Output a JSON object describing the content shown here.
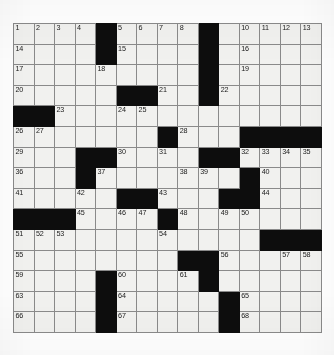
{
  "puzzle": {
    "type": "crossword-grid",
    "rows": 15,
    "cols": 15,
    "block_color": "#0d0d0d",
    "cell_color": "#f1f1ef",
    "grid_line_color": "#8a8a8a",
    "number_color": "#1a1a1a",
    "blocks": [
      [
        1,
        5
      ],
      [
        1,
        10
      ],
      [
        2,
        5
      ],
      [
        2,
        10
      ],
      [
        3,
        10
      ],
      [
        4,
        6
      ],
      [
        4,
        7
      ],
      [
        4,
        10
      ],
      [
        5,
        1
      ],
      [
        5,
        2
      ],
      [
        6,
        8
      ],
      [
        6,
        12
      ],
      [
        6,
        13
      ],
      [
        6,
        14
      ],
      [
        6,
        15
      ],
      [
        7,
        4
      ],
      [
        7,
        5
      ],
      [
        7,
        10
      ],
      [
        7,
        11
      ],
      [
        8,
        4
      ],
      [
        8,
        12
      ],
      [
        9,
        6
      ],
      [
        9,
        7
      ],
      [
        9,
        11
      ],
      [
        9,
        12
      ],
      [
        10,
        1
      ],
      [
        10,
        2
      ],
      [
        10,
        3
      ],
      [
        10,
        8
      ],
      [
        11,
        13
      ],
      [
        11,
        14
      ],
      [
        11,
        15
      ],
      [
        12,
        9
      ],
      [
        12,
        10
      ],
      [
        13,
        5
      ],
      [
        13,
        10
      ],
      [
        14,
        5
      ],
      [
        14,
        11
      ],
      [
        15,
        5
      ],
      [
        15,
        11
      ]
    ],
    "numbers": [
      {
        "row": 1,
        "col": 1,
        "n": "1"
      },
      {
        "row": 1,
        "col": 2,
        "n": "2"
      },
      {
        "row": 1,
        "col": 3,
        "n": "3"
      },
      {
        "row": 1,
        "col": 4,
        "n": "4"
      },
      {
        "row": 1,
        "col": 6,
        "n": "5"
      },
      {
        "row": 1,
        "col": 7,
        "n": "6"
      },
      {
        "row": 1,
        "col": 8,
        "n": "7"
      },
      {
        "row": 1,
        "col": 9,
        "n": "8"
      },
      {
        "row": 1,
        "col": 10,
        "n": "9"
      },
      {
        "row": 1,
        "col": 12,
        "n": "10"
      },
      {
        "row": 1,
        "col": 13,
        "n": "11"
      },
      {
        "row": 1,
        "col": 14,
        "n": "12"
      },
      {
        "row": 1,
        "col": 15,
        "n": "13"
      },
      {
        "row": 2,
        "col": 1,
        "n": "14"
      },
      {
        "row": 2,
        "col": 6,
        "n": "15"
      },
      {
        "row": 2,
        "col": 12,
        "n": "16"
      },
      {
        "row": 3,
        "col": 1,
        "n": "17"
      },
      {
        "row": 3,
        "col": 5,
        "n": "18"
      },
      {
        "row": 3,
        "col": 12,
        "n": "19"
      },
      {
        "row": 4,
        "col": 1,
        "n": "20"
      },
      {
        "row": 4,
        "col": 8,
        "n": "21"
      },
      {
        "row": 4,
        "col": 11,
        "n": "22"
      },
      {
        "row": 5,
        "col": 3,
        "n": "23"
      },
      {
        "row": 5,
        "col": 6,
        "n": "24"
      },
      {
        "row": 5,
        "col": 7,
        "n": "25"
      },
      {
        "row": 6,
        "col": 1,
        "n": "26"
      },
      {
        "row": 6,
        "col": 2,
        "n": "27"
      },
      {
        "row": 6,
        "col": 9,
        "n": "28"
      },
      {
        "row": 7,
        "col": 1,
        "n": "29"
      },
      {
        "row": 7,
        "col": 6,
        "n": "30"
      },
      {
        "row": 7,
        "col": 8,
        "n": "31"
      },
      {
        "row": 7,
        "col": 12,
        "n": "32"
      },
      {
        "row": 7,
        "col": 13,
        "n": "33"
      },
      {
        "row": 7,
        "col": 14,
        "n": "34"
      },
      {
        "row": 7,
        "col": 15,
        "n": "35"
      },
      {
        "row": 8,
        "col": 1,
        "n": "36"
      },
      {
        "row": 8,
        "col": 5,
        "n": "37"
      },
      {
        "row": 8,
        "col": 9,
        "n": "38"
      },
      {
        "row": 8,
        "col": 10,
        "n": "39"
      },
      {
        "row": 8,
        "col": 13,
        "n": "40"
      },
      {
        "row": 9,
        "col": 1,
        "n": "41"
      },
      {
        "row": 9,
        "col": 4,
        "n": "42"
      },
      {
        "row": 9,
        "col": 8,
        "n": "43"
      },
      {
        "row": 9,
        "col": 13,
        "n": "44"
      },
      {
        "row": 10,
        "col": 4,
        "n": "45"
      },
      {
        "row": 10,
        "col": 6,
        "n": "46"
      },
      {
        "row": 10,
        "col": 7,
        "n": "47"
      },
      {
        "row": 10,
        "col": 9,
        "n": "48"
      },
      {
        "row": 10,
        "col": 11,
        "n": "49"
      },
      {
        "row": 10,
        "col": 12,
        "n": "50"
      },
      {
        "row": 11,
        "col": 1,
        "n": "51"
      },
      {
        "row": 11,
        "col": 2,
        "n": "52"
      },
      {
        "row": 11,
        "col": 3,
        "n": "53"
      },
      {
        "row": 11,
        "col": 8,
        "n": "54"
      },
      {
        "row": 12,
        "col": 1,
        "n": "55"
      },
      {
        "row": 12,
        "col": 11,
        "n": "56"
      },
      {
        "row": 12,
        "col": 14,
        "n": "57"
      },
      {
        "row": 12,
        "col": 15,
        "n": "58"
      },
      {
        "row": 13,
        "col": 1,
        "n": "59"
      },
      {
        "row": 13,
        "col": 6,
        "n": "60"
      },
      {
        "row": 13,
        "col": 9,
        "n": "61"
      },
      {
        "row": 13,
        "col": 10,
        "n": "62"
      },
      {
        "row": 14,
        "col": 1,
        "n": "63"
      },
      {
        "row": 14,
        "col": 6,
        "n": "64"
      },
      {
        "row": 14,
        "col": 12,
        "n": "65"
      },
      {
        "row": 15,
        "col": 1,
        "n": "66"
      },
      {
        "row": 15,
        "col": 6,
        "n": "67"
      },
      {
        "row": 15,
        "col": 12,
        "n": "68"
      }
    ]
  }
}
